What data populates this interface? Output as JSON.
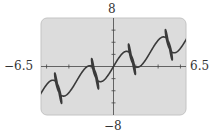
{
  "chart_data": {
    "type": "line",
    "title": "",
    "xlabel": "",
    "ylabel": "",
    "xlim": [
      -6.5,
      6.5
    ],
    "ylim": [
      -8,
      8
    ],
    "grid": false,
    "legend": null,
    "tick_labels": {
      "x_min": "−6.5",
      "x_max": "6.5",
      "y_min": "−8",
      "y_max": "8"
    },
    "x_ticks": [
      -6,
      -4,
      -2,
      2,
      4,
      6
    ],
    "y_ticks": [
      -6,
      -4,
      -2,
      2,
      4,
      6
    ],
    "series": [
      {
        "name": "parametric curve",
        "kind": "parametric",
        "description": "Rising wavy curve with four figure-eight loop clusters centered near x = -5.3, -2, 1.6, 4.7",
        "formula": {
          "x": "t + a*sin(w*t)",
          "y": "m*t + b*sin(2*w*t) + c*sin(w*t/2)",
          "a": 1.0,
          "b": 2.2,
          "c": 0.0,
          "m": 0.72,
          "w": 1.9,
          "t_range": [
            -8.5,
            8.5
          ],
          "samples": 1400
        }
      }
    ],
    "colors": {
      "plot_background": "#dcdcdc",
      "plot_border": "#c4c4c4",
      "axis": "#444444",
      "curve": "#3a3a3a"
    }
  }
}
